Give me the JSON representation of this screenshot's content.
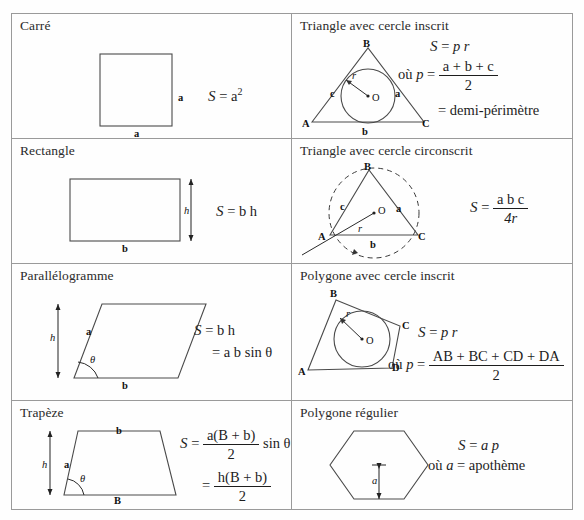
{
  "page": {
    "language": "fr",
    "kind": "geometry-area-formula-table",
    "border_color": "#9a9a9a",
    "background": "#fefefe"
  },
  "cells": [
    {
      "id": "carre",
      "title": "Carré",
      "shape": "square",
      "labels": {
        "side_right": "a",
        "side_bottom": "a"
      },
      "formula": {
        "lhs": "S",
        "eq": "=",
        "rhs": "a",
        "exponent": "2"
      }
    },
    {
      "id": "triangle-cercle-inscrit",
      "title": "Triangle avec cercle inscrit",
      "shape": "triangle-incircle",
      "labels": {
        "A": "A",
        "B": "B",
        "C": "C",
        "O": "O",
        "r": "r",
        "a": "a",
        "b": "b",
        "c": "c"
      },
      "formula": {
        "line1_lhs": "S",
        "line1_eq": "=",
        "line1_rhs": "p r",
        "line2_where": "où",
        "line2_lhs": "p",
        "line2_eq": "=",
        "line2_num": "a + b + c",
        "line2_den": "2",
        "line3_eq": "=",
        "line3_rhs": "demi-périmètre"
      }
    },
    {
      "id": "rectangle",
      "title": "Rectangle",
      "shape": "rectangle",
      "labels": {
        "height": "h",
        "base": "b"
      },
      "formula": {
        "lhs": "S",
        "eq": "=",
        "rhs": "b h"
      }
    },
    {
      "id": "triangle-cercle-circonscrit",
      "title": "Triangle avec cercle circonscrit",
      "shape": "triangle-circumcircle",
      "labels": {
        "A": "A",
        "B": "B",
        "C": "C",
        "O": "O",
        "r": "r",
        "a": "a",
        "b": "b",
        "c": "c"
      },
      "formula": {
        "lhs": "S",
        "eq": "=",
        "num": "a b c",
        "den": "4r"
      }
    },
    {
      "id": "parallelogramme",
      "title": "Parallélogramme",
      "shape": "parallelogram",
      "labels": {
        "height": "h",
        "side": "a",
        "base": "b",
        "angle": "θ"
      },
      "formula": {
        "line1_lhs": "S",
        "line1_eq": "=",
        "line1_rhs": "b h",
        "line2_eq": "=",
        "line2_rhs": "a b sin θ"
      }
    },
    {
      "id": "polygone-cercle-inscrit",
      "title": "Polygone avec cercle inscrit",
      "shape": "quadrilateral-incircle",
      "labels": {
        "A": "A",
        "B": "B",
        "C": "C",
        "D": "D",
        "O": "O",
        "r": "r"
      },
      "formula": {
        "line1_lhs": "S",
        "line1_eq": "=",
        "line1_rhs": "p r",
        "line2_where": "où",
        "line2_lhs": "p",
        "line2_eq": "=",
        "line2_num": "AB + BC + CD + DA",
        "line2_den": "2"
      }
    },
    {
      "id": "trapeze",
      "title": "Trapèze",
      "shape": "trapezoid",
      "labels": {
        "top": "b",
        "bottom": "B",
        "height": "h",
        "side": "a",
        "angle": "θ"
      },
      "formula": {
        "line1_lhs": "S",
        "line1_eq": "=",
        "line1_num": "a(B + b)",
        "line1_den": "2",
        "line1_tail": "sin θ",
        "line2_eq": "=",
        "line2_num": "h(B + b)",
        "line2_den": "2"
      }
    },
    {
      "id": "polygone-regulier",
      "title": "Polygone régulier",
      "shape": "regular-hexagon",
      "labels": {
        "apothem": "a"
      },
      "formula": {
        "line1_lhs": "S",
        "line1_eq": "=",
        "line1_rhs": "a p",
        "line2_where": "où",
        "line2_lhs": "a",
        "line2_eq": "=",
        "line2_rhs": "apothème"
      }
    }
  ]
}
